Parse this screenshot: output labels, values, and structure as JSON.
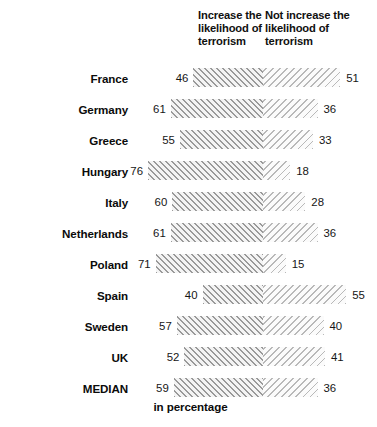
{
  "chart_data": {
    "type": "bar",
    "subtype": "diverging-stacked-bar",
    "title": "",
    "xlabel": "in percentage",
    "ylabel": "",
    "grid": false,
    "legend_position": "top",
    "axis_note": "in percentage",
    "column_headers": [
      "Increase the likelihood of terrorism",
      "Not increase the likelihood of terrorism"
    ],
    "series": [
      {
        "name": "Increase the likelihood of terrorism",
        "values": [
          46,
          61,
          55,
          76,
          60,
          61,
          71,
          40,
          57,
          52,
          59
        ]
      },
      {
        "name": "Not increase the likelihood of terrorism",
        "values": [
          51,
          36,
          33,
          18,
          28,
          36,
          15,
          55,
          40,
          41,
          36
        ]
      }
    ],
    "categories": [
      "France",
      "Germany",
      "Greece",
      "Hungary",
      "Italy",
      "Netherlands",
      "Poland",
      "Spain",
      "Sweden",
      "UK",
      "MEDIAN"
    ],
    "rows": [
      {
        "country": "France",
        "left": 46,
        "right": 51
      },
      {
        "country": "Germany",
        "left": 61,
        "right": 36
      },
      {
        "country": "Greece",
        "left": 55,
        "right": 33
      },
      {
        "country": "Hungary",
        "left": 76,
        "right": 18
      },
      {
        "country": "Italy",
        "left": 60,
        "right": 28
      },
      {
        "country": "Netherlands",
        "left": 61,
        "right": 36
      },
      {
        "country": "Poland",
        "left": 71,
        "right": 15
      },
      {
        "country": "Spain",
        "left": 40,
        "right": 55
      },
      {
        "country": "Sweden",
        "left": 57,
        "right": 40
      },
      {
        "country": "UK",
        "left": 52,
        "right": 41
      },
      {
        "country": "MEDIAN",
        "left": 59,
        "right": 36
      }
    ],
    "value_range": [
      0,
      100
    ],
    "colors": {
      "left_bar_hatch": "#9a9a9a",
      "left_bar_fill": "#e6e6e6",
      "right_bar_hatch": "#b9b9b9",
      "right_bar_fill": "#efefef",
      "text": "#111111",
      "background": "#ffffff"
    }
  },
  "headers": {
    "left": "Increase the\nlikelihood of\nterrorism",
    "right": "Not increase the\nlikelihood of\nterrorism"
  },
  "footer": {
    "note": "in percentage"
  }
}
